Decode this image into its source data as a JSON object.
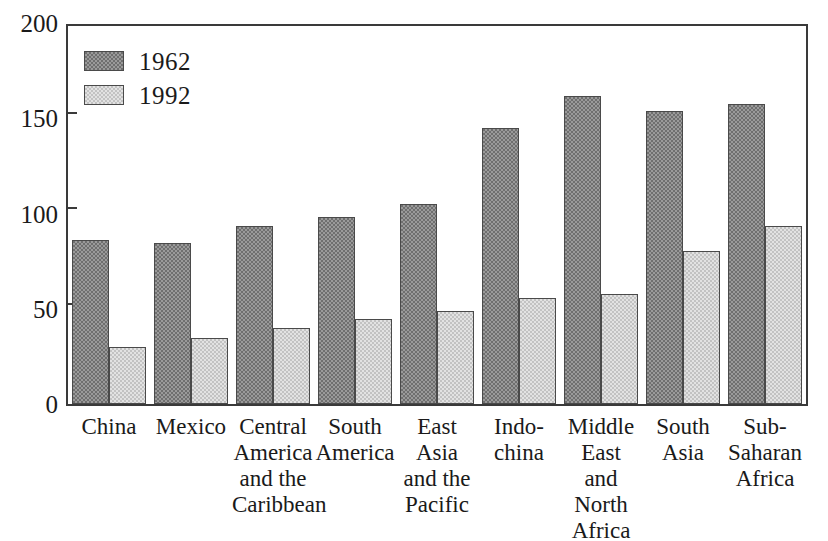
{
  "chart_data": {
    "type": "bar",
    "title": "",
    "xlabel": "",
    "ylabel": "",
    "ylim": [
      0,
      200
    ],
    "yticks": [
      0,
      50,
      100,
      150,
      200
    ],
    "ytick_labels": [
      "0",
      "50",
      "100",
      "150",
      "200"
    ],
    "grid": false,
    "legend_position": "top-left",
    "categories": [
      "China",
      "Mexico",
      "Central America and the Caribbean",
      "South America",
      "East Asia and the Pacific",
      "Indo-china",
      "Middle East and North Africa",
      "South Asia",
      "Sub-Saharan Africa"
    ],
    "category_label_lines": [
      [
        "China"
      ],
      [
        "Mexico"
      ],
      [
        "Central",
        "America",
        "and the",
        "Caribbean"
      ],
      [
        "South",
        "America"
      ],
      [
        "East",
        "Asia",
        "and the",
        "Pacific"
      ],
      [
        "Indo-",
        "china"
      ],
      [
        "Middle",
        "East",
        "and",
        "North",
        "Africa"
      ],
      [
        "South",
        "Asia"
      ],
      [
        "Sub-",
        "Saharan",
        "Africa"
      ]
    ],
    "series": [
      {
        "name": "1962",
        "color": "#6f6f6f",
        "values": [
          87,
          85,
          94,
          99,
          106,
          146,
          163,
          155,
          159
        ]
      },
      {
        "name": "1992",
        "color": "#e2e2e2",
        "values": [
          30,
          35,
          40,
          45,
          49,
          56,
          58,
          81,
          94
        ]
      }
    ]
  },
  "legend": {
    "items": [
      {
        "label": "1962",
        "swatch": "swatch-dark"
      },
      {
        "label": "1992",
        "swatch": "swatch-light"
      }
    ]
  }
}
